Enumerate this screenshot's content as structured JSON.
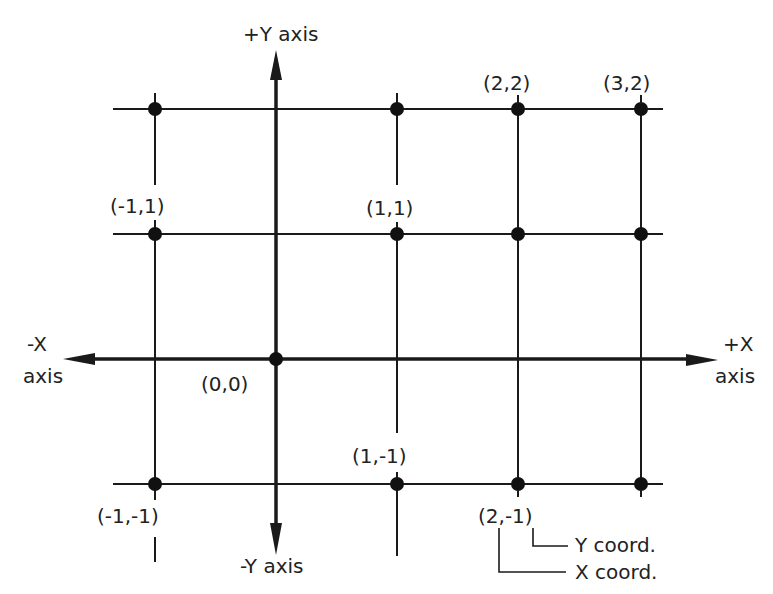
{
  "diagram": {
    "colors": {
      "line": "#1a1a1a",
      "text": "#222222",
      "background": "#ffffff"
    },
    "axes": {
      "pos_y_label": "+Y  axis",
      "neg_y_label": "-Y  axis",
      "neg_x_label_line1": "-X",
      "neg_x_label_line2": "axis",
      "pos_x_label_line1": "+X",
      "pos_x_label_line2": "axis"
    },
    "points": [
      {
        "label": "(2,2)",
        "x": 2,
        "y": 2
      },
      {
        "label": "(3,2)",
        "x": 3,
        "y": 2
      },
      {
        "label": "(-1,1)",
        "x": -1,
        "y": 1
      },
      {
        "label": "(1,1)",
        "x": 1,
        "y": 1
      },
      {
        "label": "(0,0)",
        "x": 0,
        "y": 0
      },
      {
        "label": "(1,-1)",
        "x": 1,
        "y": -1
      },
      {
        "label": "(-1,-1)",
        "x": -1,
        "y": -1
      },
      {
        "label": "(2,-1)",
        "x": 2,
        "y": -1
      }
    ],
    "unlabeled_points": [
      {
        "x": -1,
        "y": 2
      },
      {
        "x": 1,
        "y": 2
      },
      {
        "x": 2,
        "y": 1
      },
      {
        "x": 3,
        "y": 1
      },
      {
        "x": 3,
        "y": -1
      }
    ],
    "annotation": {
      "y_coord_label": "Y  coord.",
      "x_coord_label": "X  coord."
    }
  }
}
